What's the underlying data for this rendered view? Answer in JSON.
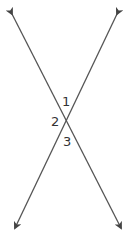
{
  "diagram": {
    "line_color": "#555555",
    "labels": [
      {
        "id": "angle-1",
        "text": "1"
      },
      {
        "id": "angle-2",
        "text": "2"
      },
      {
        "id": "angle-3",
        "text": "3"
      }
    ]
  }
}
